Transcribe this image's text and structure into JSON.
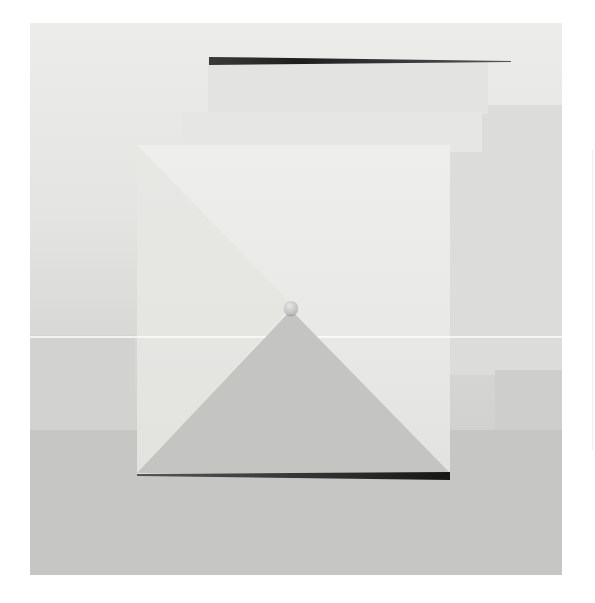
{
  "image": {
    "subject": "minimalist geometric artwork photograph",
    "elements": {
      "top_bar": "tapering dark horizontal bar",
      "big_square": "pale square panel with diagonal",
      "triangle": "grey triangle rising from bottom bar",
      "knob": "small round knob at triangle apex",
      "bottom_bar": "dark horizontal bar at base of square"
    }
  },
  "colors": {
    "paper": "#ffffff",
    "background_light": "#e8e8e6",
    "background_dark": "#c6c6c4",
    "square": "#eaeae8",
    "triangle": "#c4c4c2",
    "bar": "#2e2e2e"
  }
}
